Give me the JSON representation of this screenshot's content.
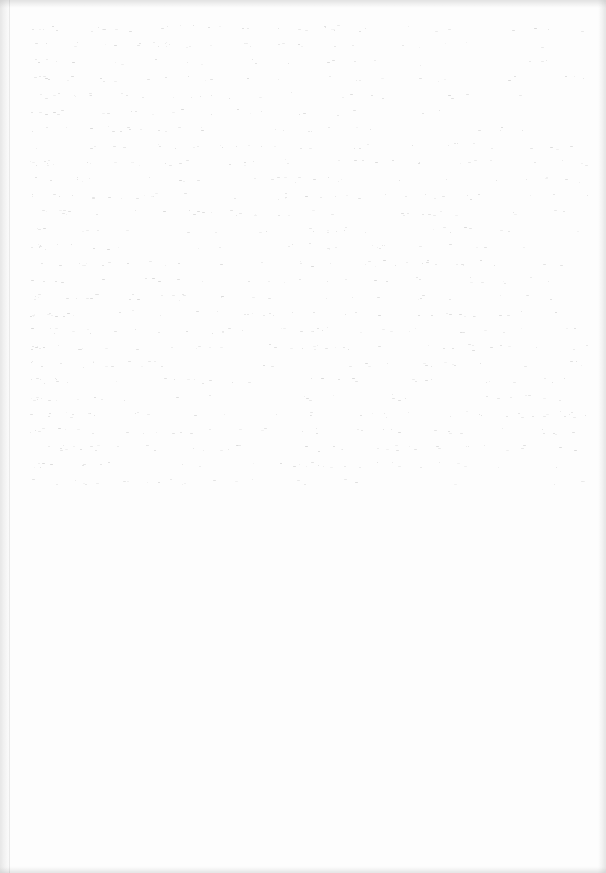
{
  "document": {
    "type": "scanned-page",
    "state": "blank",
    "text": "",
    "bleed_through_visible": true
  }
}
